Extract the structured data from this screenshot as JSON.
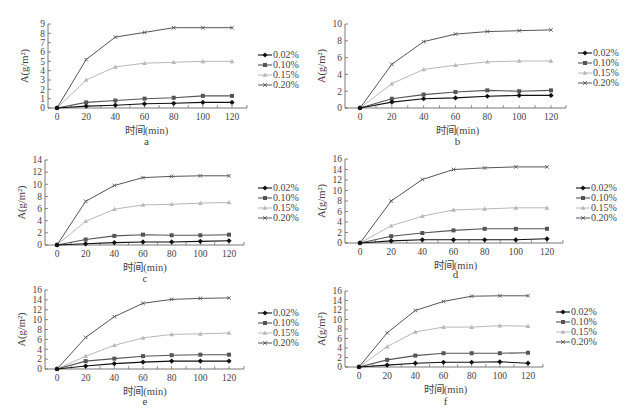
{
  "figure": {
    "width": 627,
    "height": 420,
    "series_styles": [
      {
        "name": "0.02%",
        "color": "#111111",
        "marker": "diamond",
        "width": 1.1
      },
      {
        "name": "0.10%",
        "color": "#555555",
        "marker": "square",
        "width": 1.1
      },
      {
        "name": "0.15%",
        "color": "#b8b8b8",
        "marker": "triangle",
        "width": 1.0
      },
      {
        "name": "0.20%",
        "color": "#555555",
        "marker": "cross",
        "width": 1.0
      }
    ]
  },
  "chart_data": [
    {
      "id": "a",
      "type": "line",
      "sub_label": "a",
      "title": "",
      "xlabel": "时间(min)",
      "ylabel": "A(g/m²)",
      "x": [
        0,
        20,
        40,
        60,
        80,
        100,
        120
      ],
      "xticks": [
        0,
        20,
        40,
        60,
        80,
        100,
        120
      ],
      "ylim": [
        0,
        9
      ],
      "yticks": [
        0,
        1,
        2,
        3,
        4,
        5,
        6,
        7,
        8,
        9
      ],
      "legend": [
        "0.02%",
        "0.10%",
        "0.15%",
        "0.20%"
      ],
      "legend_position": "right",
      "grid": false,
      "series": [
        {
          "name": "0.02%",
          "values": [
            0,
            0.2,
            0.3,
            0.45,
            0.5,
            0.6,
            0.6
          ]
        },
        {
          "name": "0.10%",
          "values": [
            0,
            0.6,
            0.8,
            1.0,
            1.1,
            1.3,
            1.3
          ]
        },
        {
          "name": "0.15%",
          "values": [
            0,
            3.0,
            4.4,
            4.8,
            4.9,
            5.0,
            5.0
          ]
        },
        {
          "name": "0.20%",
          "values": [
            0,
            5.2,
            7.6,
            8.1,
            8.6,
            8.6,
            8.6
          ]
        }
      ],
      "layout": {
        "left": 0,
        "top": 15,
        "axis_x": 48,
        "x0": 57,
        "x120": 232,
        "axis_end": 247,
        "y_top": 24,
        "y_bottom": 108,
        "legend_x": 258,
        "legend_y": 55,
        "sub_label_y": 145
      }
    },
    {
      "id": "b",
      "type": "line",
      "sub_label": "b",
      "title": "",
      "xlabel": "时间(min)",
      "ylabel": "A(g/m²)",
      "x": [
        0,
        20,
        40,
        60,
        80,
        100,
        120
      ],
      "xticks": [
        0,
        20,
        40,
        60,
        80,
        100,
        120
      ],
      "ylim": [
        0,
        10
      ],
      "yticks": [
        0,
        2,
        4,
        6,
        8,
        10
      ],
      "legend": [
        "0.02%",
        "0.10%",
        "0.15%",
        "0.20%"
      ],
      "legend_position": "right",
      "grid": false,
      "series": [
        {
          "name": "0.02%",
          "values": [
            0,
            0.7,
            1.1,
            1.2,
            1.4,
            1.5,
            1.5
          ]
        },
        {
          "name": "0.10%",
          "values": [
            0,
            1.1,
            1.6,
            1.9,
            2.1,
            2.0,
            2.1
          ]
        },
        {
          "name": "0.15%",
          "values": [
            0,
            2.9,
            4.6,
            5.1,
            5.5,
            5.6,
            5.6
          ]
        },
        {
          "name": "0.20%",
          "values": [
            0,
            5.2,
            7.9,
            8.8,
            9.1,
            9.2,
            9.3
          ]
        }
      ],
      "layout": {
        "left": 300,
        "top": 15,
        "axis_x": 345,
        "x0": 360,
        "x120": 551,
        "axis_end": 566,
        "y_top": 24,
        "y_bottom": 108,
        "legend_x": 578,
        "legend_y": 53,
        "sub_label_y": 145
      }
    },
    {
      "id": "c",
      "type": "line",
      "sub_label": "c",
      "title": "",
      "xlabel": "时间(min)",
      "ylabel": "A(g/m²)",
      "x": [
        0,
        20,
        40,
        60,
        80,
        100,
        120
      ],
      "xticks": [
        0,
        20,
        40,
        60,
        80,
        100,
        120
      ],
      "ylim": [
        0,
        14
      ],
      "yticks": [
        0,
        2,
        4,
        6,
        8,
        10,
        12,
        14
      ],
      "legend": [
        "0.02%",
        "0.10%",
        "0.15%",
        "0.20%"
      ],
      "legend_position": "right",
      "grid": false,
      "series": [
        {
          "name": "0.02%",
          "values": [
            0,
            0.2,
            0.4,
            0.5,
            0.5,
            0.6,
            0.7
          ]
        },
        {
          "name": "0.10%",
          "values": [
            0,
            0.9,
            1.5,
            1.7,
            1.6,
            1.6,
            1.7
          ]
        },
        {
          "name": "0.15%",
          "values": [
            0,
            3.9,
            5.9,
            6.6,
            6.7,
            6.9,
            7.0
          ]
        },
        {
          "name": "0.20%",
          "values": [
            0,
            7.2,
            9.8,
            11.1,
            11.3,
            11.4,
            11.4
          ]
        }
      ],
      "layout": {
        "left": 0,
        "top": 150,
        "axis_x": 45,
        "x0": 57,
        "x120": 229,
        "axis_end": 244,
        "y_top": 160,
        "y_bottom": 245,
        "legend_x": 258,
        "legend_y": 188,
        "sub_label_y": 282
      }
    },
    {
      "id": "d",
      "type": "line",
      "sub_label": "d",
      "title": "",
      "xlabel": "时间(min)",
      "ylabel": "A(g/m²)",
      "x": [
        0,
        20,
        40,
        60,
        80,
        100,
        120
      ],
      "xticks": [
        0,
        20,
        40,
        60,
        80,
        100,
        120
      ],
      "ylim": [
        0,
        16
      ],
      "yticks": [
        0,
        2,
        4,
        6,
        8,
        10,
        12,
        14,
        16
      ],
      "legend": [
        "0.02%",
        "0.10%",
        "0.15%",
        "0.20%"
      ],
      "legend_position": "right",
      "grid": false,
      "series": [
        {
          "name": "0.02%",
          "values": [
            0,
            0.4,
            0.6,
            0.6,
            0.6,
            0.6,
            0.8
          ]
        },
        {
          "name": "0.10%",
          "values": [
            0,
            1.3,
            1.9,
            2.4,
            2.7,
            2.7,
            2.7
          ]
        },
        {
          "name": "0.15%",
          "values": [
            0,
            3.3,
            5.1,
            6.3,
            6.5,
            6.7,
            6.7
          ]
        },
        {
          "name": "0.20%",
          "values": [
            0,
            8.0,
            12.1,
            14.0,
            14.3,
            14.5,
            14.5
          ]
        }
      ],
      "layout": {
        "left": 300,
        "top": 150,
        "axis_x": 345,
        "x0": 360,
        "x120": 547,
        "axis_end": 563,
        "y_top": 159,
        "y_bottom": 243,
        "legend_x": 576,
        "legend_y": 188,
        "sub_label_y": 278
      }
    },
    {
      "id": "e",
      "type": "line",
      "sub_label": "e",
      "title": "",
      "xlabel": "时间(min)",
      "ylabel": "A(g/m²)",
      "x": [
        0,
        20,
        40,
        60,
        80,
        100,
        120
      ],
      "xticks": [
        0,
        20,
        40,
        60,
        80,
        100,
        120
      ],
      "ylim": [
        0,
        16
      ],
      "yticks": [
        0,
        2,
        4,
        6,
        8,
        10,
        12,
        14,
        16
      ],
      "legend": [
        "0.02%",
        "0.10%",
        "0.15%",
        "0.20%"
      ],
      "legend_position": "right",
      "grid": false,
      "series": [
        {
          "name": "0.02%",
          "values": [
            0,
            0.6,
            1.1,
            1.4,
            1.6,
            1.6,
            1.6
          ]
        },
        {
          "name": "0.10%",
          "values": [
            0,
            1.6,
            2.1,
            2.6,
            2.8,
            2.9,
            2.9
          ]
        },
        {
          "name": "0.15%",
          "values": [
            0,
            2.6,
            4.8,
            6.3,
            7.0,
            7.1,
            7.3
          ]
        },
        {
          "name": "0.20%",
          "values": [
            0,
            6.4,
            10.6,
            13.3,
            14.1,
            14.3,
            14.4
          ]
        }
      ],
      "layout": {
        "left": 0,
        "top": 285,
        "axis_x": 45,
        "x0": 57,
        "x120": 229,
        "axis_end": 244,
        "y_top": 290,
        "y_bottom": 369,
        "legend_x": 258,
        "legend_y": 313,
        "sub_label_y": 405
      }
    },
    {
      "id": "f",
      "type": "line",
      "sub_label": "f",
      "title": "",
      "xlabel": "时间(min)",
      "ylabel": "A(g/m²)",
      "x": [
        0,
        20,
        40,
        60,
        80,
        100,
        120
      ],
      "xticks": [
        0,
        20,
        40,
        60,
        80,
        100,
        120
      ],
      "ylim": [
        0,
        16
      ],
      "yticks": [
        0,
        2,
        4,
        6,
        8,
        10,
        12,
        14,
        16
      ],
      "legend": [
        "0.02%",
        "0.10%",
        "0.15%",
        "0.20%"
      ],
      "legend_position": "right",
      "grid": false,
      "series": [
        {
          "name": "0.02%",
          "values": [
            0,
            0.4,
            0.8,
            1.0,
            1.0,
            1.1,
            0.8
          ]
        },
        {
          "name": "0.10%",
          "values": [
            0,
            1.5,
            2.4,
            2.9,
            2.9,
            2.9,
            3.0
          ]
        },
        {
          "name": "0.15%",
          "values": [
            0,
            4.3,
            7.4,
            8.4,
            8.4,
            8.7,
            8.6
          ]
        },
        {
          "name": "0.20%",
          "values": [
            0,
            7.2,
            11.9,
            13.8,
            14.9,
            15.0,
            15.0
          ]
        }
      ],
      "layout": {
        "left": 300,
        "top": 285,
        "axis_x": 345,
        "x0": 359,
        "x120": 528,
        "axis_end": 543,
        "y_top": 291,
        "y_bottom": 367,
        "legend_x": 556,
        "legend_y": 312,
        "sub_label_y": 405
      }
    }
  ]
}
